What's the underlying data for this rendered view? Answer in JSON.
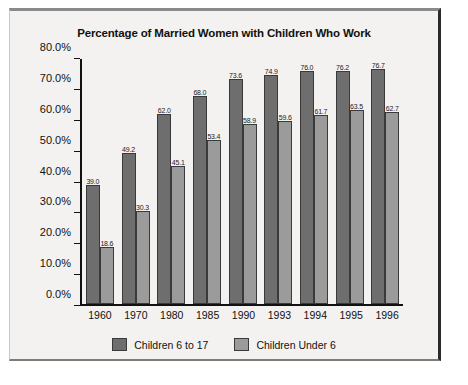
{
  "chart_data": {
    "type": "bar",
    "title": "Percentage of Married Women with Children Who Work",
    "xlabel": "",
    "ylabel": "",
    "ylim": [
      0,
      80
    ],
    "grid": false,
    "legend_position": "bottom",
    "categories": [
      "1960",
      "1970",
      "1980",
      "1985",
      "1990",
      "1993",
      "1994",
      "1995",
      "1996"
    ],
    "ytick_labels": [
      "0.0%",
      "10.0%",
      "20.0%",
      "30.0%",
      "40.0%",
      "50.0%",
      "60.0%",
      "70.0%",
      "80.0%"
    ],
    "ytick_values": [
      0,
      10,
      20,
      30,
      40,
      50,
      60,
      70,
      80
    ],
    "series": [
      {
        "name": "Children 6 to 17",
        "color": "#6e6e6e",
        "values": [
          39.0,
          49.2,
          62.0,
          68.0,
          73.6,
          74.9,
          76.0,
          76.2,
          76.7
        ],
        "labels": [
          "39.0",
          "49.2",
          "62.0",
          "68.0",
          "73.6",
          "74.9",
          "76.0",
          "76.2",
          "76.7"
        ]
      },
      {
        "name": "Children Under 6",
        "color": "#9b9b9b",
        "values": [
          18.6,
          30.3,
          45.1,
          53.4,
          58.9,
          59.6,
          61.7,
          63.5,
          62.7
        ],
        "labels": [
          "18.6",
          "30.3",
          "45.1",
          "53.4",
          "58.9",
          "59.6",
          "61.7",
          "63.5",
          "62.7"
        ]
      }
    ]
  },
  "caption": ""
}
